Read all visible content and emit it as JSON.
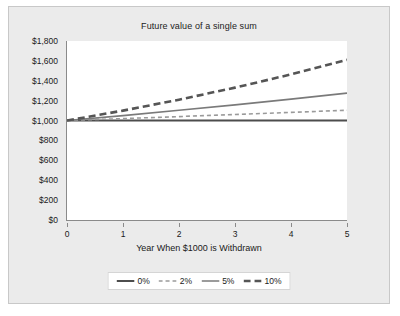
{
  "chart_data": {
    "type": "line",
    "title": "Future value of a single sum",
    "xlabel": "Year When $1000 is Withdrawn",
    "ylabel": "",
    "x": [
      0,
      1,
      2,
      3,
      4,
      5
    ],
    "xlim": [
      0,
      5
    ],
    "ylim": [
      0,
      1800
    ],
    "grid": false,
    "legend_position": "bottom",
    "xticklabels": [
      "0",
      "1",
      "2",
      "3",
      "4",
      "5"
    ],
    "yticklabels": [
      "$0",
      "$200",
      "$400",
      "$600",
      "$800",
      "$1,000",
      "$1,200",
      "$1,400",
      "$1,600",
      "$1,800"
    ],
    "ytickvalues": [
      0,
      200,
      400,
      600,
      800,
      1000,
      1200,
      1400,
      1600,
      1800
    ],
    "series": [
      {
        "name": "0%",
        "style": "solid",
        "color": "#4d4d4d",
        "width": 2.0,
        "values": [
          1000,
          1000,
          1000,
          1000,
          1000,
          1000
        ]
      },
      {
        "name": "2%",
        "style": "dashed-fine",
        "color": "#9a9a9a",
        "width": 1.6,
        "values": [
          1000,
          1020,
          1040,
          1061,
          1082,
          1104
        ]
      },
      {
        "name": "5%",
        "style": "solid",
        "color": "#7a7a7a",
        "width": 1.6,
        "values": [
          1000,
          1050,
          1103,
          1158,
          1216,
          1276
        ]
      },
      {
        "name": "10%",
        "style": "dashed-bold",
        "color": "#555555",
        "width": 2.6,
        "values": [
          1000,
          1100,
          1210,
          1331,
          1464,
          1611
        ]
      }
    ]
  },
  "legend": {
    "items": [
      {
        "label": "0%"
      },
      {
        "label": "2%"
      },
      {
        "label": "5%"
      },
      {
        "label": "10%"
      }
    ]
  },
  "colors": {
    "figure_background": "#ebebeb",
    "plot_background": "#ffffff",
    "axis": "#8a8a8a",
    "text": "#1a1a1a"
  }
}
